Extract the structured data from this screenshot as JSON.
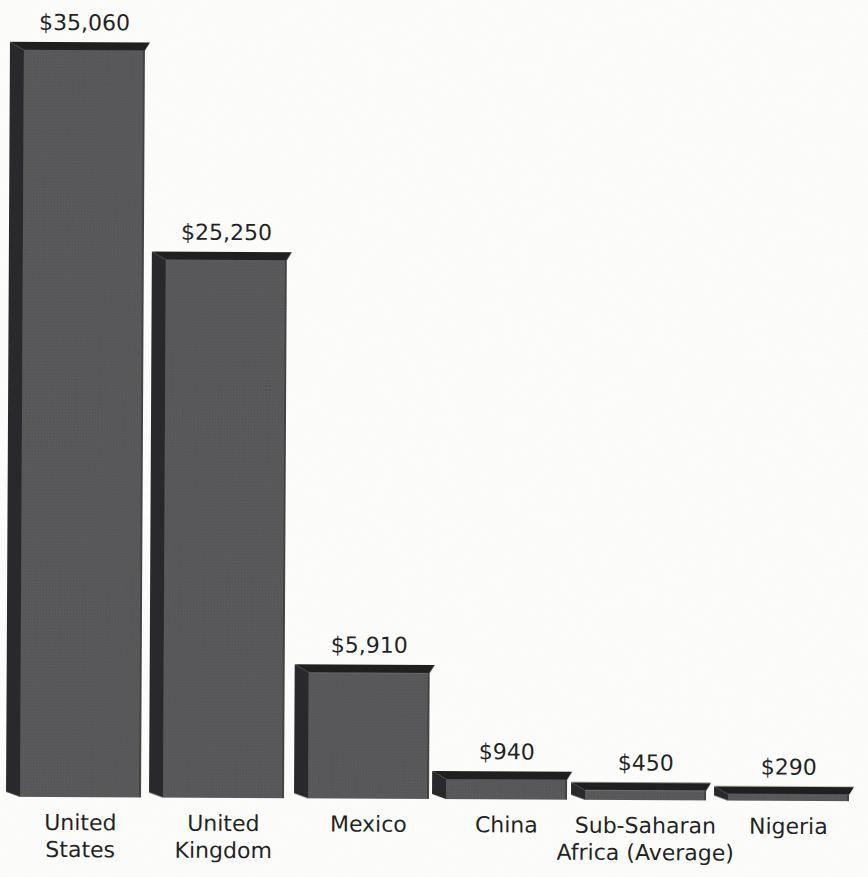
{
  "chart_data": {
    "type": "bar",
    "style": "3d-block-bars-scanned-print",
    "title": "",
    "xlabel": "",
    "ylabel": "",
    "ylim": [
      0,
      35060
    ],
    "grid": false,
    "legend": null,
    "categories": [
      "United States",
      "United Kingdom",
      "Mexico",
      "China",
      "Sub-Saharan Africa (Average)",
      "Nigeria"
    ],
    "category_label_lines": [
      [
        "United",
        "States"
      ],
      [
        "United",
        "Kingdom"
      ],
      [
        "Mexico"
      ],
      [
        "China"
      ],
      [
        "Sub-Saharan",
        "Africa (Average)"
      ],
      [
        "Nigeria"
      ]
    ],
    "values": [
      35060,
      25250,
      5910,
      940,
      450,
      290
    ],
    "value_labels": [
      "$35,060",
      "$25,250",
      "$5,910",
      "$940",
      "$450",
      "$290"
    ],
    "colors": {
      "background": "#fdfdfc",
      "bar_front": "#58585a",
      "bar_front_line": "#4b4b4d",
      "bar_side": "#28282a",
      "bar_top": "#1b1b1d",
      "bar_right_edge": "rgba(15,15,15,0.30)",
      "text": "#1f1f1f"
    }
  }
}
